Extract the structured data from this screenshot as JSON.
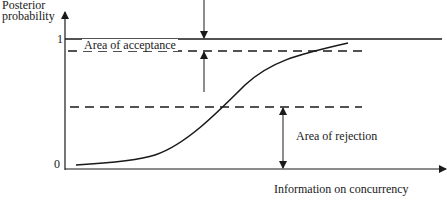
{
  "diagram": {
    "y_axis_label_line1": "Posterior",
    "y_axis_label_line2": "probability",
    "y_tick_top": "1",
    "y_tick_bottom": "0",
    "x_axis_label": "Information on concurrency",
    "area_acceptance_label": "Area of acceptance",
    "area_rejection_label": "Area of rejection",
    "line_color": "#1a1a1a"
  }
}
